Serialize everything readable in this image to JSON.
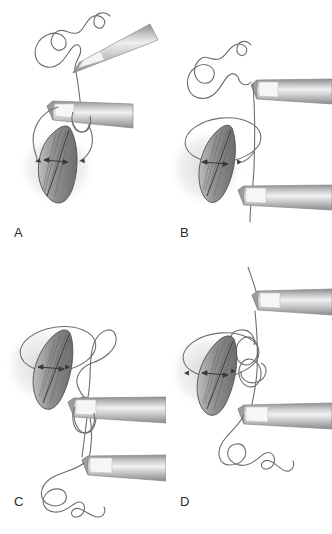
{
  "figure": {
    "background_color": "#ffffff",
    "width": 332,
    "height": 534,
    "panel_count": 4
  },
  "palette": {
    "thread": "#6e6e6e",
    "instrument_dark": "#7c7c7c",
    "instrument_mid": "#a8a8a8",
    "instrument_light": "#ececec",
    "instrument_outline": "#8a8a8a",
    "wound_fill": "#9a9a9a",
    "wound_dark": "#6a6a6a",
    "wound_outline": "#555555",
    "shadow": "#d9d9d9",
    "label_text": "#2b2b2b"
  },
  "panels": [
    {
      "id": "A",
      "label": "A",
      "caption": "Suture strand held taut; needle holder positioned with thread looped once around the shaft over the wound.",
      "instruments": 2,
      "loop_turns": 1,
      "wound_present": true,
      "free_thread_coils": 2
    },
    {
      "id": "B",
      "label": "B",
      "caption": "Thread carried around the wound; upper and lower instruments hold the two strand ends vertically.",
      "instruments": 2,
      "loop_turns": 1,
      "wound_present": true,
      "free_thread_coils": 2
    },
    {
      "id": "C",
      "label": "C",
      "caption": "Loop transferred over the upper instrument tip; short end grasped by the lower instrument.",
      "instruments": 2,
      "loop_turns": 1,
      "wound_present": true,
      "free_thread_coils": 3
    },
    {
      "id": "D",
      "label": "D",
      "caption": "Double throw formed beside the wound as the strands are drawn in opposite directions.",
      "instruments": 2,
      "loop_turns": 2,
      "wound_present": true,
      "free_thread_coils": 3
    }
  ]
}
